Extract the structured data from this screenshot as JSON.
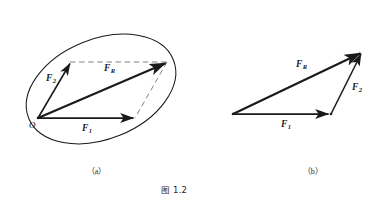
{
  "figure": {
    "caption": "图 1.2",
    "panels": [
      {
        "id": "a",
        "label": "（a）",
        "rule": "parallelogram-rule",
        "vectors": [
          {
            "name": "F1",
            "label_F": "F",
            "label_sub": "1"
          },
          {
            "name": "F2",
            "label_F": "F",
            "label_sub": "2"
          },
          {
            "name": "FR",
            "label_F": "F",
            "label_sub": "R"
          }
        ],
        "origin_label": "O"
      },
      {
        "id": "b",
        "label": "（b）",
        "rule": "triangle-rule",
        "vectors": [
          {
            "name": "F1",
            "label_F": "F",
            "label_sub": "1"
          },
          {
            "name": "F2",
            "label_F": "F",
            "label_sub": "2"
          },
          {
            "name": "FR",
            "label_F": "F",
            "label_sub": "R"
          }
        ]
      }
    ],
    "colors": {
      "stroke": "#1a1a1a",
      "dashed": "#6b6b6b",
      "background": "#ffffff",
      "text": "#1f1f1f"
    }
  }
}
